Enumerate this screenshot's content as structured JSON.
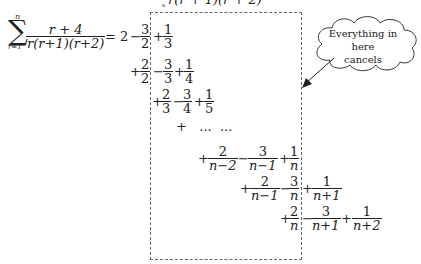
{
  "top_clip": "r(r+1)(r+2)",
  "sum": {
    "symbol": "∑",
    "upper": "n",
    "lower": "r=1",
    "numerator": "r + 4",
    "denominator": "r(r+1)(r+2)",
    "equals": "="
  },
  "lines": [
    {
      "terms": [
        "2",
        "−",
        "3/2",
        "+",
        "1/3"
      ]
    },
    {
      "terms": [
        "+",
        "2/2",
        "−",
        "3/3",
        "+",
        "1/4"
      ]
    },
    {
      "terms": [
        "+",
        "2/3",
        "−",
        "3/4",
        "+",
        "1/5"
      ]
    },
    {
      "terms": [
        "+",
        "...",
        "..."
      ]
    },
    {
      "terms": [
        "+",
        "2/(n−2)",
        "−",
        "3/(n−1)",
        "+",
        "1/n"
      ]
    },
    {
      "terms": [
        "+",
        "2/(n−1)",
        "−",
        "3/n",
        "+",
        "1/(n+1)"
      ]
    },
    {
      "terms": [
        "+",
        "2/n",
        "−",
        "3/(n+1)",
        "+",
        "1/(n+2)"
      ]
    }
  ],
  "callout": {
    "line1": "Everything in here",
    "line2": "cancels"
  },
  "t": {
    "two": "2",
    "three": "3",
    "one": "1",
    "four": "4",
    "five": "5",
    "plus": "+",
    "minus": "−",
    "dots": "+   ...  ...",
    "nm2": "n−2",
    "nm1": "n−1",
    "n": "n",
    "np1": "n+1",
    "np2": "n+2"
  }
}
